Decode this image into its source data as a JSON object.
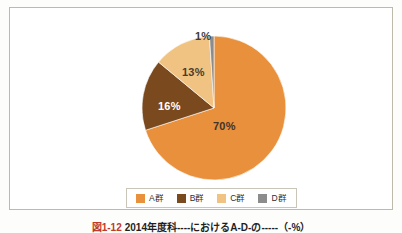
{
  "page": {
    "background_color": "#fdfdfc",
    "frame_border_color": "#bdb9ab"
  },
  "caption": {
    "marker": "図1-12",
    "text": "2014年度科----におけるA-D-の-----（-%）"
  },
  "legend": {
    "position": "bottom-center",
    "items": [
      {
        "label": "A群",
        "color": "#e8903c",
        "name": "legend-item-a"
      },
      {
        "label": "B群",
        "color": "#7a4a1e",
        "name": "legend-item-b"
      },
      {
        "label": "C群",
        "color": "#f0c383",
        "name": "legend-item-c"
      },
      {
        "label": "D群",
        "color": "#8c8c8c",
        "name": "legend-item-d"
      }
    ]
  },
  "labels": {
    "a": "70%",
    "b": "16%",
    "c": "13%",
    "d": "1%"
  },
  "chart_data": {
    "type": "pie",
    "title": "",
    "subtitle": "",
    "xlabel": "",
    "ylabel": "",
    "grid": false,
    "legend_position": "bottom",
    "unit": "%",
    "start_angle_deg": 0,
    "direction": "clockwise",
    "categories": [
      "A群",
      "B群",
      "C群",
      "D群"
    ],
    "values": [
      70,
      16,
      13,
      1
    ],
    "data_labels": [
      "70%",
      "16%",
      "13%",
      "1%"
    ],
    "colors": [
      "#e8903c",
      "#7a4a1e",
      "#f0c383",
      "#8c8c8c"
    ],
    "series": [
      {
        "name": "構成比",
        "slices": [
          {
            "label": "A群",
            "value": 70,
            "display": "70%",
            "color": "#e8903c"
          },
          {
            "label": "B群",
            "value": 16,
            "display": "16%",
            "color": "#7a4a1e"
          },
          {
            "label": "C群",
            "value": 13,
            "display": "13%",
            "color": "#f0c383"
          },
          {
            "label": "D群",
            "value": 1,
            "display": "1%",
            "color": "#8c8c8c"
          }
        ]
      }
    ]
  }
}
